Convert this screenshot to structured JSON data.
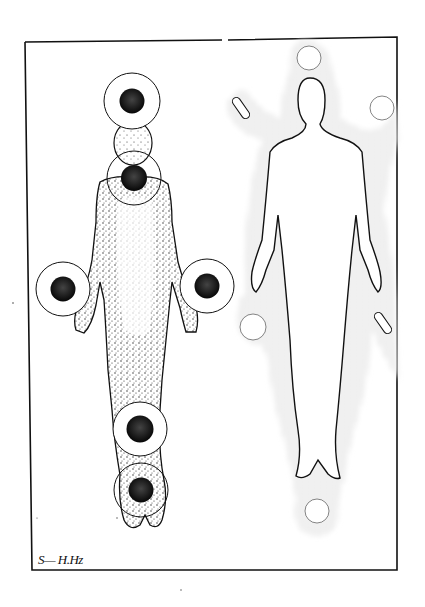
{
  "illustration": {
    "description": "Pen-and-stipple drawing of two full-length human figures inside a rectangular frame",
    "colors": {
      "paper": "#ffffff",
      "ink": "#111111",
      "disc": "#1a1a1a"
    },
    "frame": {
      "x": 25,
      "y": 40,
      "width": 372,
      "height": 530
    },
    "left_figure": {
      "style": "stippled body with dark discs in outlined rings",
      "markers": [
        {
          "name": "crown",
          "cx": 132,
          "cy": 101,
          "ring_r": 28,
          "disc_r": 12
        },
        {
          "name": "throat",
          "cx": 134,
          "cy": 178,
          "ring_r": 27,
          "disc_r": 13
        },
        {
          "name": "left-hand",
          "cx": 63,
          "cy": 289,
          "ring_r": 27,
          "disc_r": 12
        },
        {
          "name": "right-hand",
          "cx": 207,
          "cy": 286,
          "ring_r": 27,
          "disc_r": 12
        },
        {
          "name": "knee",
          "cx": 140,
          "cy": 429,
          "ring_r": 27,
          "disc_r": 13
        },
        {
          "name": "feet",
          "cx": 141,
          "cy": 490,
          "ring_r": 27,
          "disc_r": 12
        }
      ]
    },
    "right_figure": {
      "style": "white silhouette surrounded by stippled aura",
      "white_circles": [
        {
          "name": "top",
          "cx": 309,
          "cy": 58,
          "r": 12
        },
        {
          "name": "right-shoulder",
          "cx": 382,
          "cy": 108,
          "r": 12
        },
        {
          "name": "left-hand",
          "cx": 253,
          "cy": 327,
          "r": 13
        },
        {
          "name": "feet",
          "cx": 317,
          "cy": 511,
          "r": 12
        }
      ],
      "capsules": [
        {
          "name": "upper-left-capsule",
          "cx": 241,
          "cy": 108,
          "len": 24,
          "angle": 55
        },
        {
          "name": "lower-right-capsule",
          "cx": 383,
          "cy": 323,
          "len": 24,
          "angle": 55
        }
      ]
    },
    "signature": "S— H.Hz"
  }
}
